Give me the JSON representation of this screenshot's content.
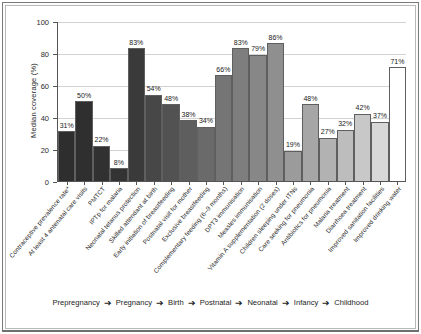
{
  "chart_data": {
    "type": "bar",
    "title": "",
    "xlabel": "",
    "ylabel": "Median coverage (%)",
    "ylim": [
      0,
      100
    ],
    "yticks": [
      0,
      20,
      40,
      60,
      80,
      100
    ],
    "grid": true,
    "legend_position": "bottom",
    "categories": [
      "Contraceptive prevalence rate*",
      "At least 4 antenatal care visits",
      "PMTCT",
      "IPTp for malaria",
      "Neonatal tetanus protection",
      "Skilled attendant at birth",
      "Early initiation of breastfeeding",
      "Postnatal visit for mother",
      "Exclusive breastfeeding",
      "Complementary feeding (6–9 months)",
      "DPT3 immunisation",
      "Measles immunisation",
      "Vitamin A supplementation (2 doses)",
      "Children sleeping under ITNs",
      "Care seeking for pneumonia",
      "Antibiotics for pneumonia",
      "Malaria treatment",
      "Diarrhoea treatment",
      "Improved sanitation facilities",
      "Improved drinking water"
    ],
    "values": [
      31,
      50,
      22,
      8,
      83,
      54,
      48,
      38,
      34,
      66,
      83,
      79,
      86,
      19,
      48,
      27,
      32,
      42,
      37,
      71
    ],
    "value_labels": [
      "31%",
      "50%",
      "22%",
      "8%",
      "83%",
      "54%",
      "48%",
      "38%",
      "34%",
      "66%",
      "83%",
      "79%",
      "86%",
      "19%",
      "48%",
      "27%",
      "32%",
      "42%",
      "37%",
      "71%"
    ],
    "bar_colors": [
      "#2e2e2e",
      "#2f2f2f",
      "#313131",
      "#333333",
      "#3a3a3a",
      "#474747",
      "#525252",
      "#5e5e5e",
      "#6a6a6a",
      "#757575",
      "#7e7e7e",
      "#878787",
      "#8f8f8f",
      "#9b9b9b",
      "#a6a6a6",
      "#b2b2b2",
      "#bdbdbd",
      "#c8c8c8",
      "#d8d8d8",
      "#ffffff"
    ],
    "timeline_stages": [
      "Prepregnancy",
      "Pregnancy",
      "Birth",
      "Postnatal",
      "Neonatal",
      "Infancy",
      "Childhood"
    ],
    "timeline_arrow": "➔"
  }
}
